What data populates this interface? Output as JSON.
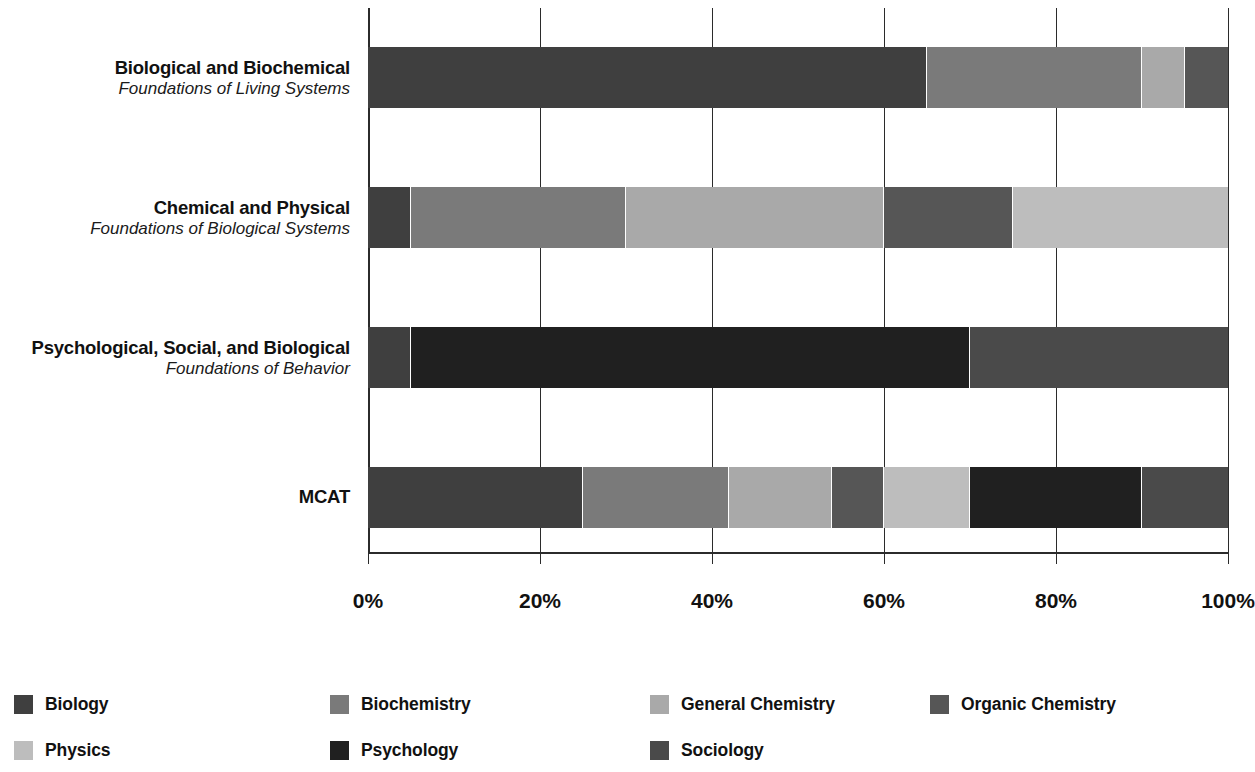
{
  "chart_data": {
    "type": "bar",
    "orientation": "horizontal",
    "stacked": true,
    "title": "",
    "xlabel": "",
    "ylabel": "",
    "xlim": [
      0,
      100
    ],
    "xticks": [
      "0%",
      "20%",
      "40%",
      "60%",
      "80%",
      "100%"
    ],
    "xtick_values": [
      0,
      20,
      40,
      60,
      80,
      100
    ],
    "grid": true,
    "legend_position": "bottom",
    "categories": [
      {
        "line1": "Biological and Biochemical",
        "line2": "Foundations of Living Systems"
      },
      {
        "line1": "Chemical and Physical",
        "line2": "Foundations of Biological Systems"
      },
      {
        "line1": "Psychological, Social, and Biological",
        "line2": "Foundations of Behavior"
      },
      {
        "line1": "MCAT",
        "line2": ""
      }
    ],
    "series": [
      {
        "name": "Biology",
        "color": "#3f3f3f",
        "values": [
          65,
          5,
          5,
          25
        ]
      },
      {
        "name": "Biochemistry",
        "color": "#7a7a7a",
        "values": [
          25,
          25,
          0,
          17
        ]
      },
      {
        "name": "General Chemistry",
        "color": "#a9a9a9",
        "values": [
          5,
          30,
          0,
          12
        ]
      },
      {
        "name": "Organic Chemistry",
        "color": "#565656",
        "values": [
          5,
          15,
          0,
          6
        ]
      },
      {
        "name": "Physics",
        "color": "#bdbdbd",
        "values": [
          0,
          25,
          0,
          10
        ]
      },
      {
        "name": "Psychology",
        "color": "#202020",
        "values": [
          0,
          0,
          65,
          20
        ]
      },
      {
        "name": "Sociology",
        "color": "#4a4a4a",
        "values": [
          0,
          0,
          30,
          10
        ]
      }
    ],
    "stacks": [
      {
        "row": 0,
        "segments": [
          {
            "name": "Biology",
            "start": 0,
            "end": 65,
            "value": 65,
            "color": "#3f3f3f"
          },
          {
            "name": "Biochemistry",
            "start": 65,
            "end": 90,
            "value": 25,
            "color": "#7a7a7a"
          },
          {
            "name": "General Chemistry",
            "start": 90,
            "end": 95,
            "value": 5,
            "color": "#a9a9a9"
          },
          {
            "name": "Organic Chemistry",
            "start": 95,
            "end": 100,
            "value": 5,
            "color": "#565656"
          }
        ]
      },
      {
        "row": 1,
        "segments": [
          {
            "name": "Biology",
            "start": 0,
            "end": 5,
            "value": 5,
            "color": "#3f3f3f"
          },
          {
            "name": "Biochemistry",
            "start": 5,
            "end": 30,
            "value": 25,
            "color": "#7a7a7a"
          },
          {
            "name": "General Chemistry",
            "start": 30,
            "end": 60,
            "value": 30,
            "color": "#a9a9a9"
          },
          {
            "name": "Organic Chemistry",
            "start": 60,
            "end": 75,
            "value": 15,
            "color": "#565656"
          },
          {
            "name": "Physics",
            "start": 75,
            "end": 100,
            "value": 25,
            "color": "#bdbdbd"
          }
        ]
      },
      {
        "row": 2,
        "segments": [
          {
            "name": "Biology",
            "start": 0,
            "end": 5,
            "value": 5,
            "color": "#3f3f3f"
          },
          {
            "name": "Psychology",
            "start": 5,
            "end": 70,
            "value": 65,
            "color": "#202020"
          },
          {
            "name": "Sociology",
            "start": 70,
            "end": 100,
            "value": 30,
            "color": "#4a4a4a"
          }
        ]
      },
      {
        "row": 3,
        "segments": [
          {
            "name": "Biology",
            "start": 0,
            "end": 25,
            "value": 25,
            "color": "#3f3f3f"
          },
          {
            "name": "Biochemistry",
            "start": 25,
            "end": 42,
            "value": 17,
            "color": "#7a7a7a"
          },
          {
            "name": "General Chemistry",
            "start": 42,
            "end": 54,
            "value": 12,
            "color": "#a9a9a9"
          },
          {
            "name": "Organic Chemistry",
            "start": 54,
            "end": 60,
            "value": 6,
            "color": "#565656"
          },
          {
            "name": "Physics",
            "start": 60,
            "end": 70,
            "value": 10,
            "color": "#bdbdbd"
          },
          {
            "name": "Psychology",
            "start": 70,
            "end": 90,
            "value": 20,
            "color": "#202020"
          },
          {
            "name": "Sociology",
            "start": 90,
            "end": 100,
            "value": 10,
            "color": "#4a4a4a"
          }
        ]
      }
    ]
  },
  "legend": {
    "items": [
      {
        "label": "Biology",
        "color": "#3f3f3f"
      },
      {
        "label": "Biochemistry",
        "color": "#7a7a7a"
      },
      {
        "label": "General Chemistry",
        "color": "#a9a9a9"
      },
      {
        "label": "Organic Chemistry",
        "color": "#565656"
      },
      {
        "label": "Physics",
        "color": "#bdbdbd"
      },
      {
        "label": "Psychology",
        "color": "#202020"
      },
      {
        "label": "Sociology",
        "color": "#4a4a4a"
      }
    ]
  },
  "colors": {
    "axis": "#2b2b2b",
    "background": "#ffffff",
    "text": "#111111"
  }
}
